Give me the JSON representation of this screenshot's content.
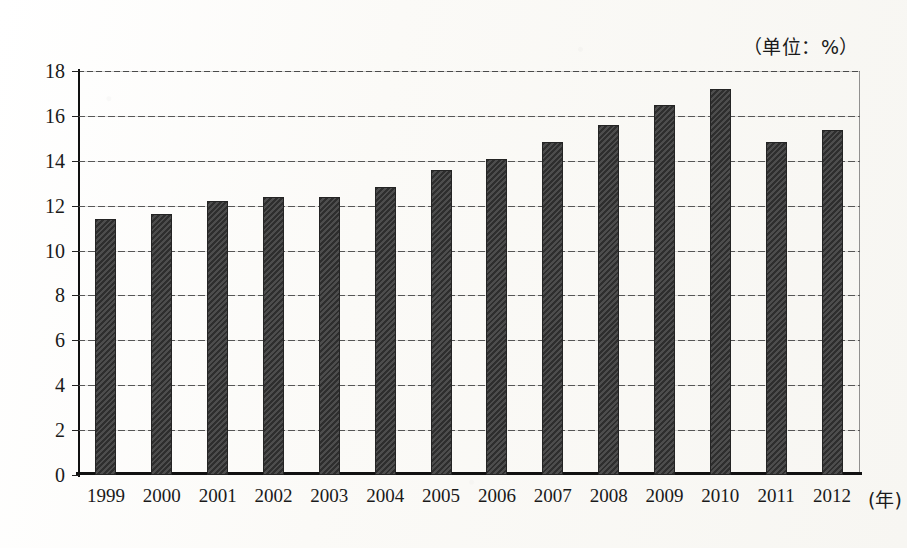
{
  "chart_data": {
    "type": "bar",
    "title": "",
    "unit_label": "（单位：%）",
    "xlabel": "(年)",
    "ylabel": "",
    "ylim": [
      0,
      18
    ],
    "ytick_step": 2,
    "yticks": [
      18,
      16,
      14,
      12,
      10,
      8,
      6,
      4,
      2,
      0
    ],
    "grid": true,
    "legend": "none",
    "categories": [
      "1999",
      "2000",
      "2001",
      "2002",
      "2003",
      "2004",
      "2005",
      "2006",
      "2007",
      "2008",
      "2009",
      "2010",
      "2011",
      "2012"
    ],
    "values": [
      11.4,
      11.65,
      12.2,
      12.4,
      12.4,
      12.85,
      13.6,
      14.1,
      14.85,
      15.6,
      16.5,
      17.2,
      14.85,
      15.35
    ],
    "bar_color": "#3a3a3a"
  }
}
